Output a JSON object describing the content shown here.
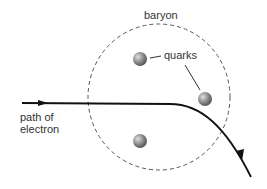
{
  "diagram": {
    "labels": {
      "baryon": "baryon",
      "quarks": "quarks",
      "path_line1": "path of",
      "path_line2": "electron"
    },
    "colors": {
      "line": "#111111",
      "circle": "#555555",
      "quark": "#888888",
      "text": "#333333"
    }
  }
}
